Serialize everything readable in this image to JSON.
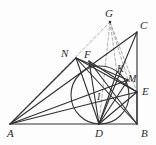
{
  "figure": {
    "kind": "euclidean-geometry-diagram",
    "canvas": {
      "width": 156,
      "height": 145
    },
    "colors": {
      "stroke": "#2f2f2f",
      "dashed_stroke": "#9a9a9a",
      "circle_stroke": "#3a3a3a",
      "label": "#2b2b2b",
      "background": "#fdfdfd"
    },
    "points": [
      {
        "id": "A",
        "label": "A",
        "x": 10,
        "y": 124,
        "label_x": 7,
        "label_y": 128,
        "dot": false
      },
      {
        "id": "B",
        "label": "B",
        "x": 137,
        "y": 124,
        "label_x": 141,
        "label_y": 128,
        "dot": false
      },
      {
        "id": "C",
        "label": "C",
        "x": 137,
        "y": 32,
        "label_x": 140,
        "label_y": 20,
        "dot": false
      },
      {
        "id": "D",
        "label": "D",
        "x": 99,
        "y": 124,
        "label_x": 95,
        "label_y": 128,
        "dot": false
      },
      {
        "id": "E",
        "label": "E",
        "x": 137,
        "y": 92,
        "label_x": 142,
        "label_y": 86,
        "dot": false
      },
      {
        "id": "F",
        "label": "F",
        "x": 89,
        "y": 61,
        "label_x": 84,
        "label_y": 49,
        "dot": false
      },
      {
        "id": "G",
        "label": "G",
        "x": 110,
        "y": 22,
        "label_x": 105,
        "label_y": 8,
        "dot": true
      },
      {
        "id": "I",
        "label": "I",
        "x": 100,
        "y": 95,
        "label_x": 97,
        "label_y": 92,
        "dot": false
      },
      {
        "id": "K",
        "label": "K",
        "x": 117,
        "y": 72,
        "label_x": 117,
        "label_y": 64,
        "dot": false
      },
      {
        "id": "M",
        "label": "M",
        "x": 128,
        "y": 80,
        "label_x": 128,
        "label_y": 74,
        "dot": false
      },
      {
        "id": "N",
        "label": "N",
        "x": 76,
        "y": 58,
        "label_x": 61,
        "label_y": 48,
        "dot": false
      }
    ],
    "incircle": {
      "cx": 100,
      "cy": 95,
      "r": 29
    },
    "solid_segments": [
      {
        "from": "A",
        "to": "B",
        "name": "side-ab"
      },
      {
        "from": "C",
        "to": "B",
        "name": "side-cb"
      },
      {
        "from": "A",
        "to": "C",
        "name": "side-ac"
      },
      {
        "from": "A",
        "to": "N",
        "name": "segment-an"
      },
      {
        "from": "N",
        "to": "D",
        "name": "segment-nd"
      },
      {
        "from": "N",
        "to": "B",
        "name": "segment-nb"
      },
      {
        "from": "N",
        "to": "E",
        "name": "segment-ne"
      },
      {
        "from": "N",
        "to": "M",
        "name": "segment-nm"
      },
      {
        "from": "A",
        "to": "E",
        "name": "segment-ae"
      },
      {
        "from": "A",
        "to": "M",
        "name": "segment-am"
      },
      {
        "from": "D",
        "to": "F",
        "name": "segment-df"
      },
      {
        "from": "D",
        "to": "K",
        "name": "segment-dk"
      },
      {
        "from": "D",
        "to": "M",
        "name": "segment-dm"
      },
      {
        "from": "D",
        "to": "E",
        "name": "segment-de"
      },
      {
        "from": "D",
        "to": "C",
        "name": "segment-dc"
      },
      {
        "from": "F",
        "to": "B",
        "name": "segment-fb"
      },
      {
        "from": "F",
        "to": "E",
        "name": "segment-fe"
      },
      {
        "from": "E",
        "to": "B",
        "name": "segment-eb"
      }
    ],
    "dashed_segments": [
      {
        "from": "A",
        "to": "G",
        "name": "dashed-ag"
      },
      {
        "from": "G",
        "to": "D",
        "name": "dashed-gd"
      },
      {
        "from": "G",
        "to": "K",
        "name": "dashed-gk"
      },
      {
        "from": "G",
        "to": "M",
        "name": "dashed-gm"
      },
      {
        "from": "G",
        "to": "E",
        "name": "dashed-ge"
      }
    ]
  }
}
